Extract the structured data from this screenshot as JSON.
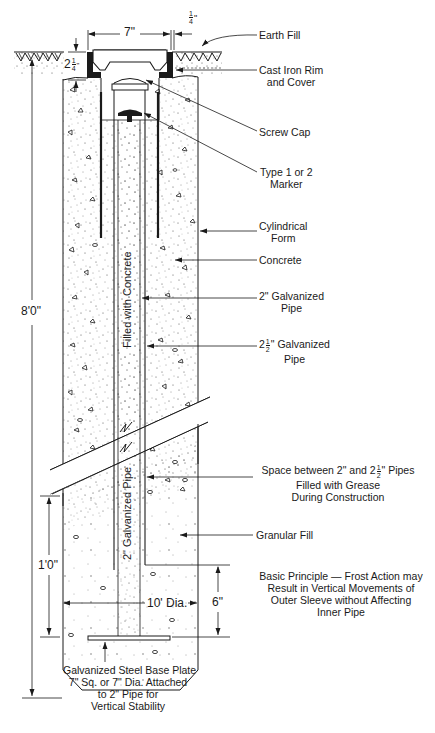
{
  "diagram": {
    "labels": {
      "earth_fill": "Earth Fill",
      "cast_iron_rim_l1": "Cast Iron Rim",
      "cast_iron_rim_l2": "and Cover",
      "screw_cap": "Screw Cap",
      "marker_l1": "Type 1 or 2",
      "marker_l2": "Marker",
      "cylindrical_form_l1": "Cylindrical",
      "cylindrical_form_l2": "Form",
      "concrete": "Concrete",
      "pipe_2_l1": "2\" Galvanized",
      "pipe_2_l2": "Pipe",
      "pipe_25_whole": "2",
      "pipe_25_num": "1",
      "pipe_25_den": "2",
      "pipe_25_rest": "\" Galvanized",
      "pipe_25_l2": "Pipe",
      "grease_l1_a": "Space between 2\" and 2",
      "grease_l1_num": "1",
      "grease_l1_den": "2",
      "grease_l1_b": "\" Pipes",
      "grease_l2": "Filled with Grease",
      "grease_l3": "During Construction",
      "granular_fill": "Granular Fill",
      "principle_l1": "Basic Principle — Frost Action may",
      "principle_l2": "Result in Vertical Movements of",
      "principle_l3": "Outer Sleeve without Affecting",
      "principle_l4": "Inner Pipe",
      "base_plate_l1": "Galvanized Steel Base Plate",
      "base_plate_l2": "7\" Sq. or 7\" Dia. Attached",
      "base_plate_l3": "to 2\" Pipe for",
      "base_plate_l4": "Vertical Stability",
      "filled_with_concrete": "Filled with Concrete",
      "pipe_2_vertical": "2\" Galvanized Pipe"
    },
    "dimensions": {
      "cover_width": "7\"",
      "gap_num": "1",
      "gap_den": "4",
      "gap_unit": "\"",
      "depth_whole": "2",
      "depth_num": "1",
      "depth_den": "4",
      "depth_unit": "\"",
      "total_height": "8'0\"",
      "granular_height": "1'0\"",
      "diameter": "10' Dia.",
      "plate_height": "6\""
    },
    "colors": {
      "line": "#1a1a1a",
      "fill": "#ffffff"
    }
  }
}
